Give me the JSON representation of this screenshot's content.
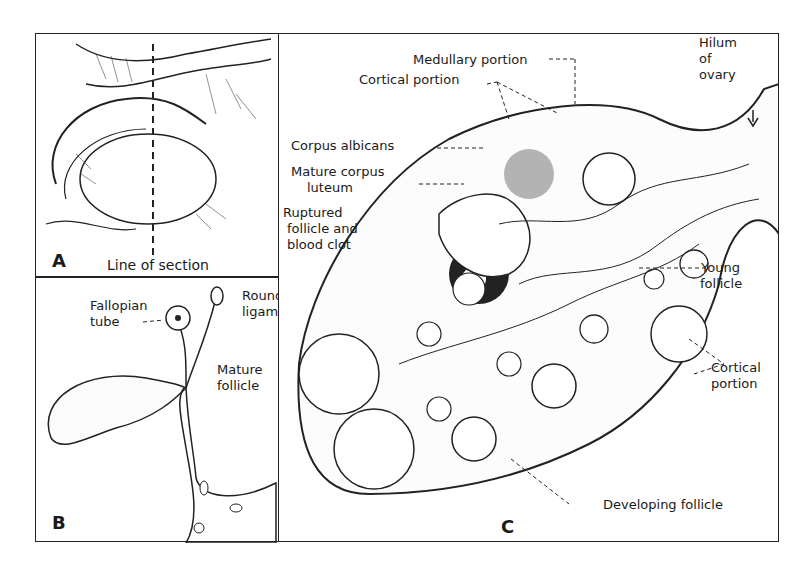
{
  "figure": {
    "panels": [
      {
        "letter": "A",
        "labels": {
          "line_of_section": "Line of section"
        }
      },
      {
        "letter": "B",
        "labels": {
          "fallopian_tube_1": "Fallopian",
          "fallopian_tube_2": "tube",
          "round_ligament_1": "Round",
          "round_ligament_2": "ligament"
        }
      },
      {
        "letter": "C",
        "labels": {
          "medullary_portion": "Medullary portion",
          "cortical_portion_top": "Cortical portion",
          "hilum_1": "Hilum",
          "hilum_2": "of",
          "hilum_3": "ovary",
          "corpus_albicans": "Corpus albicans",
          "mature_corpus_luteum_1": "Mature corpus",
          "mature_corpus_luteum_2": "luteum",
          "ruptured_1": "Ruptured",
          "ruptured_2": "follicle and",
          "ruptured_3": "blood clot",
          "young_follicle_1": "Young",
          "young_follicle_2": "follicle",
          "mature_follicle_1": "Mature",
          "mature_follicle_2": "follicle",
          "cortical_portion_right_1": "Cortical",
          "cortical_portion_right_2": "portion",
          "developing_follicle": "Developing follicle"
        }
      }
    ]
  }
}
